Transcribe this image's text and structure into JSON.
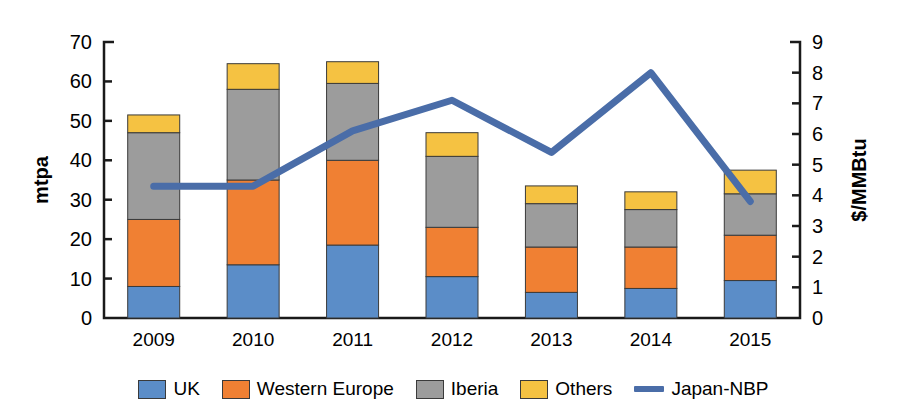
{
  "chart_data": {
    "type": "bar",
    "title": "",
    "subtitle": "",
    "categories": [
      "2009",
      "2010",
      "2011",
      "2012",
      "2013",
      "2014",
      "2015"
    ],
    "xlabel": "",
    "ylabel": "mtpa",
    "ylabel_secondary": "$/MMBtu",
    "ylim": [
      0,
      70
    ],
    "ylim_secondary": [
      0,
      9
    ],
    "yticks": [
      0,
      10,
      20,
      30,
      40,
      50,
      60,
      70
    ],
    "yticks_secondary": [
      0,
      1,
      2,
      3,
      4,
      5,
      6,
      7,
      8,
      9
    ],
    "grid": false,
    "stacked": true,
    "legend_position": "bottom",
    "series": [
      {
        "name": "UK",
        "type": "bar",
        "color": "#5B8DC8",
        "axis": "left",
        "values": [
          8,
          13.5,
          18.5,
          10.5,
          6.5,
          7.5,
          9.5
        ]
      },
      {
        "name": "Western Europe",
        "type": "bar",
        "color": "#F08033",
        "axis": "left",
        "values": [
          17,
          21.5,
          21.5,
          12.5,
          11.5,
          10.5,
          11.5
        ]
      },
      {
        "name": "Iberia",
        "type": "bar",
        "color": "#9C9C9C",
        "axis": "left",
        "values": [
          22,
          23,
          19.5,
          18,
          11,
          9.5,
          10.5
        ]
      },
      {
        "name": "Others",
        "type": "bar",
        "color": "#F5C242",
        "axis": "left",
        "values": [
          4.5,
          6.5,
          5.5,
          6,
          4.5,
          4.5,
          6
        ]
      },
      {
        "name": "Japan-NBP",
        "type": "line",
        "color": "#4A6DA8",
        "axis": "right",
        "values": [
          4.3,
          4.3,
          6.1,
          7.1,
          5.4,
          8.0,
          3.8
        ]
      }
    ],
    "totals": [
      51.5,
      64.5,
      65.0,
      47.0,
      33.5,
      32.0,
      37.5
    ]
  },
  "legend": {
    "items": [
      {
        "label": "UK",
        "marker": "swatch",
        "color": "#5B8DC8"
      },
      {
        "label": "Western Europe",
        "marker": "swatch",
        "color": "#F08033"
      },
      {
        "label": "Iberia",
        "marker": "swatch",
        "color": "#9C9C9C"
      },
      {
        "label": "Others",
        "marker": "swatch",
        "color": "#F5C242"
      },
      {
        "label": "Japan-NBP",
        "marker": "line",
        "color": "#4A6DA8"
      }
    ]
  }
}
